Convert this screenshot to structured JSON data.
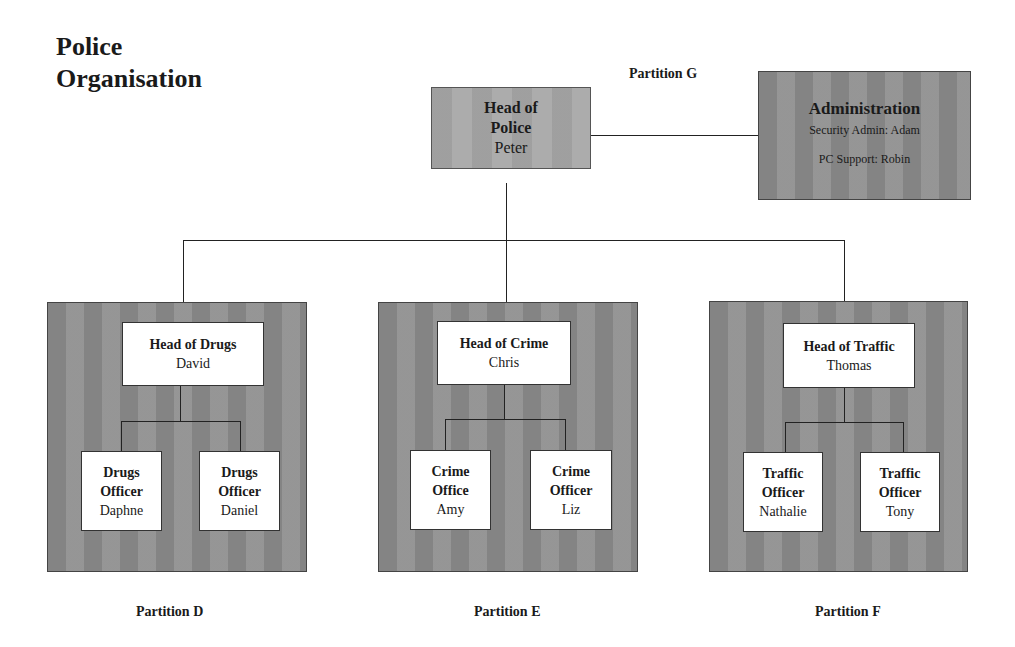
{
  "title": {
    "line1": "Police",
    "line2": "Organisation"
  },
  "partition_g": {
    "label": "Partition G",
    "head": {
      "role_line1": "Head of",
      "role_line2": "Police",
      "name": "Peter"
    },
    "admin": {
      "title": "Administration",
      "line1": "Security Admin: Adam",
      "line2": "PC Support: Robin"
    }
  },
  "partitions": [
    {
      "label": "Partition D",
      "head": {
        "role": "Head of Drugs",
        "name": "David"
      },
      "members": [
        {
          "role_line1": "Drugs",
          "role_line2": "Officer",
          "name": "Daphne"
        },
        {
          "role_line1": "Drugs",
          "role_line2": "Officer",
          "name": "Daniel"
        }
      ]
    },
    {
      "label": "Partition E",
      "head": {
        "role": "Head of Crime",
        "name": "Chris"
      },
      "members": [
        {
          "role_line1": "Crime",
          "role_line2": "Office",
          "name": "Amy"
        },
        {
          "role_line1": "Crime",
          "role_line2": "Officer",
          "name": "Liz"
        }
      ]
    },
    {
      "label": "Partition F",
      "head": {
        "role": "Head of Traffic",
        "name": "Thomas"
      },
      "members": [
        {
          "role_line1": "Traffic",
          "role_line2": "Officer",
          "name": "Nathalie"
        },
        {
          "role_line1": "Traffic",
          "role_line2": "Officer",
          "name": "Tony"
        }
      ]
    }
  ]
}
